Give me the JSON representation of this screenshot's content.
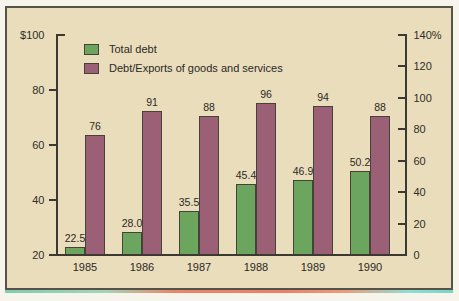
{
  "figure": {
    "panel_background": "#e9ddbc",
    "border_color": "#55524a",
    "page_background": "#f7f4ec"
  },
  "chart_data": {
    "type": "bar",
    "categories": [
      "1985",
      "1986",
      "1987",
      "1988",
      "1989",
      "1990"
    ],
    "series": [
      {
        "name": "Total debt",
        "color": "#6ba55e",
        "axis": "left",
        "values": [
          22.5,
          28.0,
          35.5,
          45.4,
          46.9,
          50.2
        ],
        "labels": [
          "22.5",
          "28.0",
          "35.5",
          "45.4",
          "46.9",
          "50.2"
        ]
      },
      {
        "name": "Debt/Exports of goods and services",
        "color": "#9c6076",
        "axis": "right",
        "values": [
          76,
          91,
          88,
          96,
          94,
          88
        ],
        "labels": [
          "76",
          "91",
          "88",
          "96",
          "94",
          "88"
        ]
      }
    ],
    "left_axis": {
      "min": 20,
      "max": 100,
      "ticks": [
        20,
        40,
        60,
        80,
        100
      ],
      "tick_labels": [
        "20",
        "40",
        "60",
        "80",
        "$100"
      ]
    },
    "right_axis": {
      "min": 0,
      "max": 140,
      "ticks": [
        0,
        20,
        40,
        60,
        80,
        100,
        120,
        140
      ],
      "tick_labels": [
        "0",
        "20",
        "40",
        "60",
        "80",
        "100",
        "120",
        "140%"
      ]
    },
    "legend": {
      "position": "top-left-inside"
    },
    "grid": false,
    "title": "",
    "xlabel": "",
    "ylabel_left": "US$ (billions)",
    "ylabel_right": "percent"
  }
}
